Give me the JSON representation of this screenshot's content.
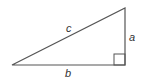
{
  "diagram": {
    "type": "right-triangle",
    "colors": {
      "stroke": "#555555",
      "text": "#333333",
      "background": "#ffffff"
    },
    "vertices": {
      "left": [
        12,
        65
      ],
      "right_angle": [
        125,
        65
      ],
      "top": [
        125,
        8
      ]
    },
    "labels": {
      "hypotenuse": "c",
      "vertical_leg": "a",
      "horizontal_leg": "b"
    },
    "right_angle_marker": true
  }
}
